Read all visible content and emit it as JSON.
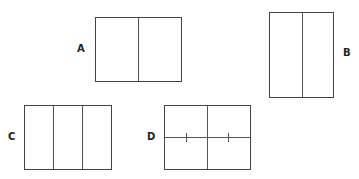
{
  "figures": [
    {
      "label": "A",
      "layout": "two vertical panels, landscape"
    },
    {
      "label": "B",
      "layout": "two vertical panels, portrait"
    },
    {
      "label": "C",
      "layout": "three vertical panels, landscape"
    },
    {
      "label": "D",
      "layout": "four quadrants with tick marks on horizontal divider"
    }
  ],
  "colors": {
    "line": "#444444",
    "text": "#222222",
    "background": "#ffffff"
  }
}
